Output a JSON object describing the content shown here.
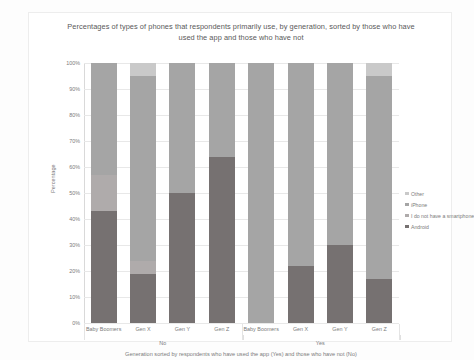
{
  "chart_data": {
    "type": "bar",
    "subtype": "stacked-percentage-column",
    "title": "Percentages of types of phones that respondents primarily use, by generation, sorted by those who have used the app and those who have not",
    "xlabel": "Generation sorted by respondents who have used the app (Yes) and those who have not (No)",
    "ylabel": "Percentage",
    "ylim": [
      0,
      100
    ],
    "yticks": [
      "0%",
      "10%",
      "20%",
      "30%",
      "40%",
      "50%",
      "60%",
      "70%",
      "80%",
      "90%",
      "100%"
    ],
    "grid": true,
    "legend_position": "right",
    "categories": [
      "Baby Boomers",
      "Gen X",
      "Gen Y",
      "Gen Z",
      "Baby Boomers",
      "Gen X",
      "Gen Y",
      "Gen Z"
    ],
    "groups": [
      {
        "label": "No",
        "categories": [
          "Baby Boomers",
          "Gen X",
          "Gen Y",
          "Gen Z"
        ]
      },
      {
        "label": "Yes",
        "categories": [
          "Baby Boomers",
          "Gen X",
          "Gen Y",
          "Gen Z"
        ]
      }
    ],
    "series": [
      {
        "name": "Android",
        "color": "#767171",
        "values": [
          43,
          19,
          50,
          64,
          0,
          22,
          30,
          17
        ]
      },
      {
        "name": "I do not have a smartphone",
        "color": "#afabab",
        "values": [
          14,
          5,
          0,
          0,
          0,
          0,
          0,
          0
        ]
      },
      {
        "name": "iPhone",
        "color": "#a5a5a5",
        "values": [
          43,
          71,
          50,
          36,
          100,
          78,
          70,
          78
        ]
      },
      {
        "name": "Other",
        "color": "#c9c9c9",
        "values": [
          0,
          5,
          0,
          0,
          0,
          0,
          0,
          5
        ]
      }
    ],
    "legend": [
      {
        "label": "Other",
        "color": "#c9c9c9"
      },
      {
        "label": "iPhone",
        "color": "#a5a5a5"
      },
      {
        "label": "I do not have a smartphone",
        "color": "#afabab"
      },
      {
        "label": "Android",
        "color": "#767171"
      }
    ]
  }
}
